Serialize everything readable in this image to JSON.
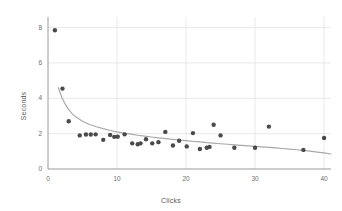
{
  "chart_data": {
    "type": "scatter",
    "title": "",
    "subtitle": "",
    "xlabel": "Clicks",
    "ylabel": "Seconds",
    "xlim": [
      0,
      41
    ],
    "ylim": [
      0,
      8.6
    ],
    "xticks": [
      0,
      10,
      20,
      30,
      40
    ],
    "yticks": [
      0,
      2,
      4,
      6,
      8
    ],
    "xtick_labels": [
      "0",
      "10",
      "20",
      "30",
      "40"
    ],
    "ytick_labels": [
      "0",
      "2",
      "4",
      "6",
      "8"
    ],
    "grid": "horizontal-and-vertical-light",
    "legend": "none",
    "series": [
      {
        "name": "observations",
        "type": "scatter",
        "color": "#4a4a4a",
        "marker": "circle",
        "marker_size": 4.4,
        "points": [
          {
            "x": 1.0,
            "y": 7.85
          },
          {
            "x": 2.1,
            "y": 4.55
          },
          {
            "x": 3.0,
            "y": 2.7
          },
          {
            "x": 4.6,
            "y": 1.9
          },
          {
            "x": 5.5,
            "y": 1.95
          },
          {
            "x": 6.2,
            "y": 1.95
          },
          {
            "x": 6.9,
            "y": 1.96
          },
          {
            "x": 8.0,
            "y": 1.65
          },
          {
            "x": 9.0,
            "y": 1.93
          },
          {
            "x": 9.6,
            "y": 1.82
          },
          {
            "x": 10.1,
            "y": 1.83
          },
          {
            "x": 11.1,
            "y": 1.96
          },
          {
            "x": 12.2,
            "y": 1.45
          },
          {
            "x": 13.0,
            "y": 1.4
          },
          {
            "x": 13.4,
            "y": 1.45
          },
          {
            "x": 14.2,
            "y": 1.68
          },
          {
            "x": 15.1,
            "y": 1.45
          },
          {
            "x": 16.0,
            "y": 1.52
          },
          {
            "x": 17.0,
            "y": 2.1
          },
          {
            "x": 18.1,
            "y": 1.33
          },
          {
            "x": 19.0,
            "y": 1.6
          },
          {
            "x": 20.1,
            "y": 1.28
          },
          {
            "x": 21.0,
            "y": 2.03
          },
          {
            "x": 22.0,
            "y": 1.13
          },
          {
            "x": 23.0,
            "y": 1.2
          },
          {
            "x": 23.4,
            "y": 1.25
          },
          {
            "x": 24.0,
            "y": 2.5
          },
          {
            "x": 25.0,
            "y": 1.9
          },
          {
            "x": 27.0,
            "y": 1.2
          },
          {
            "x": 30.0,
            "y": 1.2
          },
          {
            "x": 32.0,
            "y": 2.4
          },
          {
            "x": 37.0,
            "y": 1.08
          },
          {
            "x": 40.0,
            "y": 1.75
          }
        ]
      },
      {
        "name": "fitted-decay-curve",
        "type": "line",
        "color": "#a8a8a8",
        "points": [
          {
            "x": 1.5,
            "y": 4.6
          },
          {
            "x": 2.0,
            "y": 4.05
          },
          {
            "x": 2.5,
            "y": 3.66
          },
          {
            "x": 3.0,
            "y": 3.36
          },
          {
            "x": 3.5,
            "y": 3.13
          },
          {
            "x": 4.0,
            "y": 2.95
          },
          {
            "x": 5.0,
            "y": 2.7
          },
          {
            "x": 6.0,
            "y": 2.52
          },
          {
            "x": 7.0,
            "y": 2.39
          },
          {
            "x": 8.0,
            "y": 2.28
          },
          {
            "x": 9.0,
            "y": 2.18
          },
          {
            "x": 10.0,
            "y": 2.1
          },
          {
            "x": 11.0,
            "y": 2.03
          },
          {
            "x": 12.0,
            "y": 1.97
          },
          {
            "x": 13.0,
            "y": 1.91
          },
          {
            "x": 14.0,
            "y": 1.86
          },
          {
            "x": 15.0,
            "y": 1.81
          },
          {
            "x": 16.0,
            "y": 1.76
          },
          {
            "x": 17.0,
            "y": 1.72
          },
          {
            "x": 18.0,
            "y": 1.68
          },
          {
            "x": 19.0,
            "y": 1.64
          },
          {
            "x": 20.0,
            "y": 1.6
          },
          {
            "x": 21.0,
            "y": 1.56
          },
          {
            "x": 22.0,
            "y": 1.53
          },
          {
            "x": 23.0,
            "y": 1.49
          },
          {
            "x": 24.0,
            "y": 1.46
          },
          {
            "x": 25.0,
            "y": 1.43
          },
          {
            "x": 26.0,
            "y": 1.4
          },
          {
            "x": 27.0,
            "y": 1.37
          },
          {
            "x": 28.0,
            "y": 1.34
          },
          {
            "x": 29.0,
            "y": 1.31
          },
          {
            "x": 30.0,
            "y": 1.28
          },
          {
            "x": 31.0,
            "y": 1.25
          },
          {
            "x": 32.0,
            "y": 1.22
          },
          {
            "x": 33.0,
            "y": 1.19
          },
          {
            "x": 34.0,
            "y": 1.16
          },
          {
            "x": 35.0,
            "y": 1.12
          },
          {
            "x": 36.0,
            "y": 1.09
          },
          {
            "x": 37.0,
            "y": 1.05
          },
          {
            "x": 38.0,
            "y": 1.01
          },
          {
            "x": 39.0,
            "y": 0.96
          },
          {
            "x": 40.0,
            "y": 0.91
          },
          {
            "x": 41.0,
            "y": 0.85
          }
        ]
      }
    ]
  },
  "style": {
    "marker_color": "#4a4a4a",
    "curve_color": "#a8a8a8",
    "grid_color": "#e3e3e3",
    "axis_color": "#9a9a9a",
    "tick_text_color": "#6e6e6e",
    "axis_title_color": "#5a5a5a",
    "background": "#ffffff"
  }
}
